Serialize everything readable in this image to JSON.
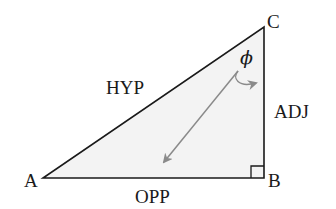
{
  "diagram": {
    "type": "right-triangle",
    "colors": {
      "fill": "#f3f3f3",
      "stroke": "#1a1a1a",
      "arrow": "#8a8a8a"
    },
    "vertices": {
      "A": {
        "label": "A",
        "x": 43,
        "y": 178
      },
      "B": {
        "label": "B",
        "x": 264,
        "y": 178
      },
      "C": {
        "label": "C",
        "x": 264,
        "y": 27
      }
    },
    "angle": {
      "symbol": "ϕ",
      "at_vertex": "C"
    },
    "right_angle_at": "B",
    "sides": {
      "hypotenuse": "HYP",
      "adjacent": "ADJ",
      "opposite": "OPP"
    }
  }
}
